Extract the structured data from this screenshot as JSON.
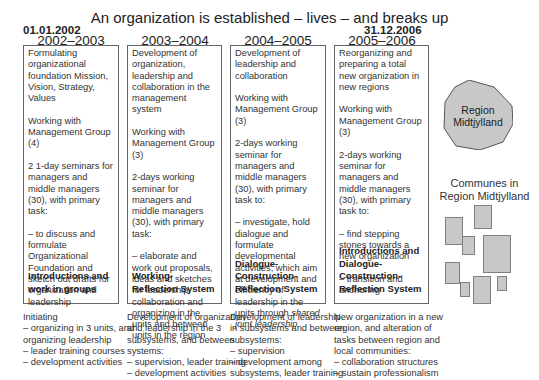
{
  "title": "An organization is established – lives – and breaks up",
  "start_date": "01.01.2002",
  "end_date": "31.12.2006",
  "columns": [
    {
      "period": "2002–2003",
      "paragraphs": [
        "Formulating organizational foundation Mission, Vision, Strategy, Values",
        "Working with Management Group (4)",
        "2 1-day seminars for managers and middle managers (30), with primary task:",
        "– to discuss and formulate Organizational Foundation and sketch out drafts for organization and leadership"
      ],
      "system": "Introductions and work in groups",
      "below": [
        "Initiating",
        "– organizing in 3 units, and",
        "organizing leadership",
        "– leader training courses",
        "– development activities"
      ]
    },
    {
      "period": "2003–2004",
      "paragraphs": [
        "Development of organization, leadership and collaboration in the management system",
        "Working with Management Group (3)",
        "2-days working seminar for managers and middle managers (30), with primary task:",
        "– elaborate and work out proposals, ideas and sketches for leadership, collaboration and organizing in the units and between units in the region"
      ],
      "system": "Working-Reflection System",
      "below": [
        "Development of organization",
        "and leadership in the 3",
        "subsystems, and between",
        "systems:",
        "– supervision, leader training",
        "– development activities"
      ]
    },
    {
      "period": "2004–2005",
      "paragraphs": [
        "Development of leadership and collaboration",
        "Working with Management Group (3)",
        "2-days working seminar for managers and middle managers (30), with primary task to:"
      ],
      "last_paragraph_plain": "– investigate, hold dialogue and formulate developmental activities, which aim at development and efficiency of leadership in the units through ",
      "last_paragraph_italic": "shared joint leadership",
      "system": "Dialogue-Construction-Reflection System",
      "below": [
        "Development of leadership",
        "in subsystems and between",
        "subsystems:",
        "– supervision",
        "– development among",
        "subsystems, leader training"
      ]
    },
    {
      "period": "2005–2006",
      "paragraphs": [
        "Reorganizing and preparing a total new organization in new regions",
        "Working with Management Group (3)",
        "2-days working seminar for managers and middle managers (30), with primary task to:",
        "– find stepping stones towards a new organization",
        "– transition and anchoring"
      ],
      "system": "Introductions and Dialogue-Construction-Reflection System",
      "below": [
        "New organization in a new",
        "region, and alteration of",
        "tasks between region and",
        "local communities:",
        "– collaboration structures",
        "– sustain professionalism"
      ]
    }
  ],
  "region": {
    "label_line1": "Region",
    "label_line2": "Midtjylland",
    "fill_color": "#c8c8c8",
    "stroke_color": "#555555"
  },
  "communes": {
    "label_line1": "Communes in",
    "label_line2": "Region Midtjylland"
  }
}
